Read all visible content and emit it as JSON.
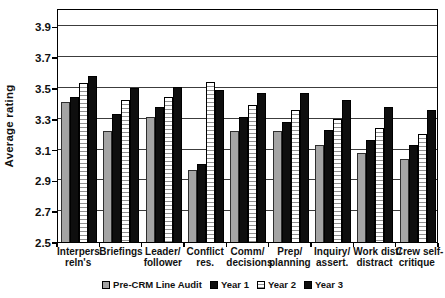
{
  "chart_data": {
    "type": "bar",
    "title": "",
    "xlabel": "",
    "ylabel": "Average rating",
    "ylim": [
      2.5,
      4.0
    ],
    "ytick_labels": [
      "2.5",
      "2.7",
      "2.9",
      "3.1",
      "3.3",
      "3.5",
      "3.7",
      "3.9"
    ],
    "grid": true,
    "legend_position": "bottom-center",
    "categories": [
      "Interpers. reln's",
      "Briefings",
      "Leader/ follower",
      "Conflict res.",
      "Comm/ decisions",
      "Prep/ planning",
      "Inquiry/ assert.",
      "Work dist/ distract",
      "Crew self- critique"
    ],
    "category_label_lines": [
      [
        "Interpers.",
        "reln's"
      ],
      [
        "Briefings"
      ],
      [
        "Leader/",
        "follower"
      ],
      [
        "Conflict",
        "res."
      ],
      [
        "Comm/",
        "decisions"
      ],
      [
        "Prep/",
        "planning"
      ],
      [
        "Inquiry/",
        "assert."
      ],
      [
        "Work dist/",
        "distract"
      ],
      [
        "Crew self-",
        "critique"
      ]
    ],
    "series": [
      {
        "name": "Pre-CRM Line Audit",
        "style": "gray-solid",
        "values": [
          3.41,
          3.22,
          3.31,
          2.97,
          3.22,
          3.22,
          3.13,
          3.08,
          3.04
        ]
      },
      {
        "name": "Year 1",
        "style": "black-solid",
        "values": [
          3.44,
          3.33,
          3.38,
          3.01,
          3.31,
          3.28,
          3.23,
          3.16,
          3.13
        ]
      },
      {
        "name": "Year 2",
        "style": "white-striped",
        "values": [
          3.53,
          3.42,
          3.44,
          3.54,
          3.39,
          3.36,
          3.3,
          3.24,
          3.2
        ]
      },
      {
        "name": "Year 3",
        "style": "black-solid",
        "values": [
          3.58,
          3.5,
          3.51,
          3.49,
          3.47,
          3.47,
          3.42,
          3.38,
          3.36
        ]
      }
    ],
    "colors": {
      "gray_fill": "#a4a4a4",
      "black_fill": "#0e0e0e",
      "stripe_line": "#909090",
      "outline": "#000000",
      "gridline": "#3c3c3c",
      "background": "#ffffff"
    }
  }
}
